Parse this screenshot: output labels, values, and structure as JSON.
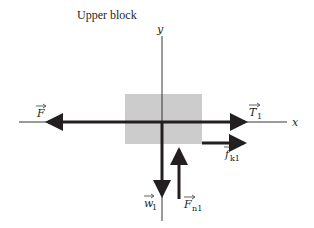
{
  "title": "Upper block",
  "axes": {
    "x_label": "x",
    "y_label": "y"
  },
  "block": {
    "fill": "#cccccc"
  },
  "forces": [
    {
      "id": "F",
      "symbol": "F",
      "subscript": "",
      "direction": "left"
    },
    {
      "id": "T1",
      "symbol": "T",
      "subscript": "1",
      "direction": "right"
    },
    {
      "id": "fk1",
      "symbol": "f",
      "subscript": "k1",
      "direction": "right"
    },
    {
      "id": "w1",
      "symbol": "w",
      "subscript": "1",
      "direction": "down"
    },
    {
      "id": "Fn1",
      "symbol": "F",
      "subscript": "n1",
      "direction": "up"
    }
  ],
  "colors": {
    "arrow": "#231f20",
    "axis": "#231f20",
    "block": "#cccccc",
    "background": "#ffffff"
  }
}
